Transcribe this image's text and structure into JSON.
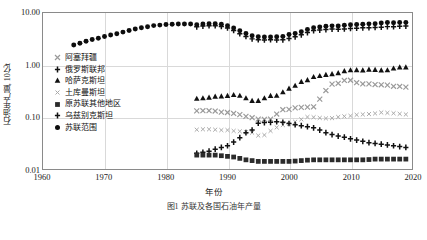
{
  "axes": {
    "y_title": "石油年产量, 10亿t",
    "x_title": "年份",
    "y_ticks": [
      "10.00",
      "1.00",
      "0.10",
      "0.01"
    ],
    "x_ticks": [
      "1960",
      "1970",
      "1980",
      "1990",
      "2000",
      "2010",
      "2020"
    ]
  },
  "caption": "图1  苏联及各国石油年产量",
  "legend": [
    {
      "label": "阿塞拜疆",
      "marker": "x-icon",
      "color": "#9a9a9a"
    },
    {
      "label": "俄罗斯联邦",
      "marker": "plus-icon",
      "color": "#111111"
    },
    {
      "label": "哈萨克斯坦",
      "marker": "triangle-icon",
      "color": "#111111"
    },
    {
      "label": "土库曼斯坦",
      "marker": "x-small-icon",
      "color": "#a8a8a8"
    },
    {
      "label": "原苏联其他地区",
      "marker": "square-icon",
      "color": "#2b2b2b"
    },
    {
      "label": "乌兹别克斯坦",
      "marker": "plus-icon",
      "color": "#111111"
    },
    {
      "label": "苏联范围",
      "marker": "circle-icon",
      "color": "#0d0d0d"
    }
  ],
  "chart_data": {
    "type": "scatter",
    "title": "",
    "xlabel": "年份",
    "ylabel": "石油年产量, 10亿t",
    "xlim": [
      1960,
      2020
    ],
    "ylim": [
      0.01,
      10.0
    ],
    "yscale": "log",
    "grid": true,
    "legend_position": "inside-left",
    "series": [
      {
        "name": "苏联范围",
        "marker": "circle",
        "color": "#0d0d0d",
        "x": [
          1965,
          1966,
          1967,
          1968,
          1969,
          1970,
          1971,
          1972,
          1973,
          1974,
          1975,
          1976,
          1977,
          1978,
          1979,
          1980,
          1981,
          1982,
          1983,
          1984,
          1985,
          1986,
          1987,
          1988,
          1989,
          1990,
          1991,
          1992,
          1993,
          1994,
          1995,
          1996,
          1997,
          1998,
          1999,
          2000,
          2001,
          2002,
          2003,
          2004,
          2005,
          2006,
          2007,
          2008,
          2009,
          2010,
          2011,
          2012,
          2013,
          2014,
          2015,
          2016,
          2017,
          2018,
          2019
        ],
        "y": [
          2.43,
          2.63,
          2.86,
          3.09,
          3.28,
          3.53,
          3.77,
          4.0,
          4.29,
          4.59,
          4.91,
          5.2,
          5.46,
          5.72,
          5.85,
          6.03,
          6.09,
          6.13,
          6.16,
          6.13,
          5.95,
          6.15,
          6.24,
          6.24,
          6.07,
          5.7,
          5.15,
          4.55,
          4.05,
          3.66,
          3.5,
          3.45,
          3.47,
          3.49,
          3.55,
          3.85,
          4.05,
          4.36,
          4.8,
          5.2,
          5.4,
          5.55,
          5.66,
          5.64,
          5.82,
          5.95,
          6.0,
          6.1,
          6.18,
          6.22,
          6.4,
          6.55,
          6.5,
          6.6,
          6.6
        ]
      },
      {
        "name": "俄罗斯联邦",
        "marker": "plus",
        "color": "#111111",
        "x": [
          1985,
          1986,
          1987,
          1988,
          1989,
          1990,
          1991,
          1992,
          1993,
          1994,
          1995,
          1996,
          1997,
          1998,
          1999,
          2000,
          2001,
          2002,
          2003,
          2004,
          2005,
          2006,
          2007,
          2008,
          2009,
          2010,
          2011,
          2012,
          2013,
          2014,
          2015,
          2016,
          2017,
          2018,
          2019
        ],
        "y": [
          5.42,
          5.62,
          5.7,
          5.69,
          5.52,
          5.16,
          4.62,
          4.0,
          3.54,
          3.18,
          3.07,
          3.03,
          3.06,
          3.04,
          3.05,
          3.24,
          3.48,
          3.8,
          4.21,
          4.59,
          4.7,
          4.81,
          4.91,
          4.88,
          4.94,
          5.05,
          5.11,
          5.18,
          5.23,
          5.27,
          5.34,
          5.47,
          5.46,
          5.56,
          5.6
        ]
      },
      {
        "name": "哈萨克斯坦",
        "marker": "triangle",
        "color": "#111111",
        "x": [
          1985,
          1986,
          1987,
          1988,
          1989,
          1990,
          1991,
          1992,
          1993,
          1994,
          1995,
          1996,
          1997,
          1998,
          1999,
          2000,
          2001,
          2002,
          2003,
          2004,
          2005,
          2006,
          2007,
          2008,
          2009,
          2010,
          2011,
          2012,
          2013,
          2014,
          2015,
          2016,
          2017,
          2018,
          2019
        ],
        "y": [
          0.225,
          0.23,
          0.237,
          0.248,
          0.251,
          0.256,
          0.266,
          0.258,
          0.231,
          0.205,
          0.205,
          0.231,
          0.256,
          0.258,
          0.3,
          0.353,
          0.4,
          0.475,
          0.513,
          0.59,
          0.616,
          0.65,
          0.672,
          0.7,
          0.765,
          0.796,
          0.8,
          0.794,
          0.818,
          0.808,
          0.792,
          0.795,
          0.862,
          0.905,
          0.905
        ]
      },
      {
        "name": "阿塞拜疆",
        "marker": "x",
        "color": "#9a9a9a",
        "x": [
          1985,
          1986,
          1987,
          1988,
          1989,
          1990,
          1991,
          1992,
          1993,
          1994,
          1995,
          1996,
          1997,
          1998,
          1999,
          2000,
          2001,
          2002,
          2003,
          2004,
          2005,
          2006,
          2007,
          2008,
          2009,
          2010,
          2011,
          2012,
          2013,
          2014,
          2015,
          2016,
          2017,
          2018,
          2019
        ],
        "y": [
          0.131,
          0.132,
          0.132,
          0.13,
          0.124,
          0.122,
          0.117,
          0.111,
          0.103,
          0.097,
          0.091,
          0.09,
          0.091,
          0.114,
          0.138,
          0.14,
          0.15,
          0.153,
          0.155,
          0.157,
          0.221,
          0.323,
          0.428,
          0.445,
          0.505,
          0.509,
          0.456,
          0.432,
          0.434,
          0.421,
          0.416,
          0.41,
          0.389,
          0.387,
          0.375
        ]
      },
      {
        "name": "土库曼斯坦",
        "marker": "x-small",
        "color": "#a8a8a8",
        "x": [
          1985,
          1986,
          1987,
          1988,
          1989,
          1990,
          1991,
          1992,
          1993,
          1994,
          1995,
          1996,
          1997,
          1998,
          1999,
          2000,
          2001,
          2002,
          2003,
          2004,
          2005,
          2006,
          2007,
          2008,
          2009,
          2010,
          2011,
          2012,
          2013,
          2014,
          2015,
          2016,
          2017,
          2018,
          2019
        ],
        "y": [
          0.057,
          0.058,
          0.058,
          0.057,
          0.056,
          0.056,
          0.054,
          0.053,
          0.051,
          0.05,
          0.044,
          0.045,
          0.054,
          0.063,
          0.07,
          0.073,
          0.081,
          0.09,
          0.1,
          0.099,
          0.096,
          0.094,
          0.095,
          0.1,
          0.103,
          0.105,
          0.11,
          0.112,
          0.114,
          0.117,
          0.122,
          0.12,
          0.118,
          0.115,
          0.112
        ]
      },
      {
        "name": "乌兹别克斯坦",
        "marker": "plus",
        "color": "#111111",
        "x": [
          1985,
          1986,
          1987,
          1988,
          1989,
          1990,
          1991,
          1992,
          1993,
          1994,
          1995,
          1996,
          1997,
          1998,
          1999,
          2000,
          2001,
          2002,
          2003,
          2004,
          2005,
          2006,
          2007,
          2008,
          2009,
          2010,
          2011,
          2012,
          2013,
          2014,
          2015,
          2016,
          2017,
          2018,
          2019
        ],
        "y": [
          0.02,
          0.021,
          0.022,
          0.024,
          0.026,
          0.028,
          0.033,
          0.04,
          0.05,
          0.056,
          0.076,
          0.078,
          0.079,
          0.081,
          0.079,
          0.075,
          0.071,
          0.068,
          0.065,
          0.062,
          0.056,
          0.05,
          0.046,
          0.043,
          0.041,
          0.038,
          0.036,
          0.034,
          0.032,
          0.031,
          0.03,
          0.029,
          0.028,
          0.027,
          0.026
        ]
      },
      {
        "name": "原苏联其他地区",
        "marker": "square",
        "color": "#2b2b2b",
        "x": [
          1985,
          1986,
          1987,
          1988,
          1989,
          1990,
          1991,
          1992,
          1993,
          1994,
          1995,
          1996,
          1997,
          1998,
          1999,
          2000,
          2001,
          2002,
          2003,
          2004,
          2005,
          2006,
          2007,
          2008,
          2009,
          2010,
          2011,
          2012,
          2013,
          2014,
          2015,
          2016,
          2017,
          2018,
          2019
        ],
        "y": [
          0.0185,
          0.0185,
          0.0185,
          0.0185,
          0.018,
          0.0175,
          0.017,
          0.016,
          0.015,
          0.0145,
          0.014,
          0.014,
          0.014,
          0.014,
          0.014,
          0.014,
          0.0142,
          0.0145,
          0.0148,
          0.015,
          0.015,
          0.015,
          0.015,
          0.015,
          0.015,
          0.015,
          0.015,
          0.015,
          0.0152,
          0.0155,
          0.0155,
          0.0155,
          0.0155,
          0.0155,
          0.0155
        ]
      }
    ]
  }
}
